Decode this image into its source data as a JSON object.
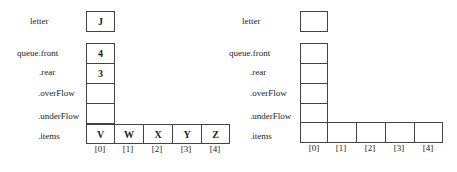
{
  "left": {
    "labels": {
      "letter": "letter",
      "front": "queue.front",
      "rear": ".rear",
      "overFlow": ".overFlow",
      "underFlow": ".underFlow",
      "items": ".items"
    },
    "values": {
      "letter": "J",
      "front": "4",
      "rear": "3",
      "overFlow": "",
      "underFlow": ""
    },
    "items": [
      "V",
      "W",
      "X",
      "Y",
      "Z"
    ],
    "indices": [
      "[0]",
      "[1]",
      "[2]",
      "[3]",
      "[4]"
    ]
  },
  "right": {
    "labels": {
      "letter": "letter",
      "front": "queue.front",
      "rear": ".rear",
      "overFlow": ".overFlow",
      "underFlow": ".underFlow",
      "items": ".items"
    },
    "values": {
      "letter": "",
      "front": "",
      "rear": "",
      "overFlow": "",
      "underFlow": ""
    },
    "items": [
      "",
      "",
      "",
      "",
      ""
    ],
    "indices": [
      "[0]",
      "[1]",
      "[2]",
      "[3]",
      "[4]"
    ]
  }
}
